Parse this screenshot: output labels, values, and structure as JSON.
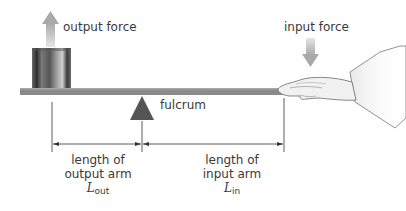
{
  "diagram": {
    "type": "lever",
    "labels": {
      "output_force": "output force",
      "input_force": "input force",
      "fulcrum": "fulcrum",
      "output_arm_line1": "length of",
      "output_arm_line2": "output arm",
      "output_arm_var": "L",
      "output_arm_sub": "out",
      "input_arm_line1": "length of",
      "input_arm_line2": "input arm",
      "input_arm_var": "L",
      "input_arm_sub": "in"
    },
    "elements": {
      "beam": "gray horizontal plank",
      "load": "dark metallic cylinder",
      "fulcrum": "dark gray triangle",
      "effort": "hand pressing down on beam",
      "arrows": [
        "output force arrow (up)",
        "input force arrow (down)"
      ]
    },
    "colors": {
      "beam": "#8a8a8a",
      "fulcrum": "#555555",
      "arrow": "#b5b5b5",
      "dimension_line": "#333333",
      "text": "#3a3a3a"
    }
  }
}
